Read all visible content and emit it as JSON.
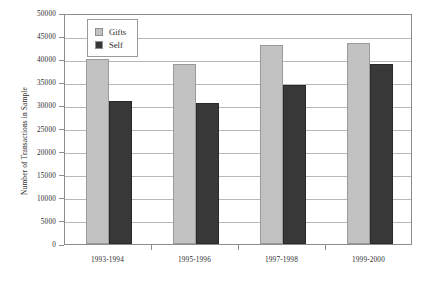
{
  "chart_data": {
    "type": "bar",
    "title": "",
    "xlabel": "",
    "ylabel": "Number of Transactions in Sample",
    "categories": [
      "1993-1994",
      "1995-1996",
      "1997-1998",
      "1999-2000"
    ],
    "series": [
      {
        "name": "Gifts",
        "color": "#c2c2c2",
        "values": [
          40000,
          39000,
          43000,
          43500
        ]
      },
      {
        "name": "Self",
        "color": "#383838",
        "values": [
          31000,
          30500,
          34500,
          39000
        ]
      }
    ],
    "ylim": [
      0,
      50000
    ],
    "yticks": [
      0,
      5000,
      10000,
      15000,
      20000,
      25000,
      30000,
      35000,
      40000,
      45000,
      50000
    ],
    "ytick_labels": [
      "0",
      "5000",
      "10000",
      "15000",
      "20000",
      "25000",
      "30000",
      "35000",
      "40000",
      "45000",
      "50000"
    ],
    "grid": true,
    "legend_position": "upper-left-inside"
  },
  "legend": {
    "entries": [
      {
        "label": "Gifts"
      },
      {
        "label": "Self"
      }
    ]
  }
}
